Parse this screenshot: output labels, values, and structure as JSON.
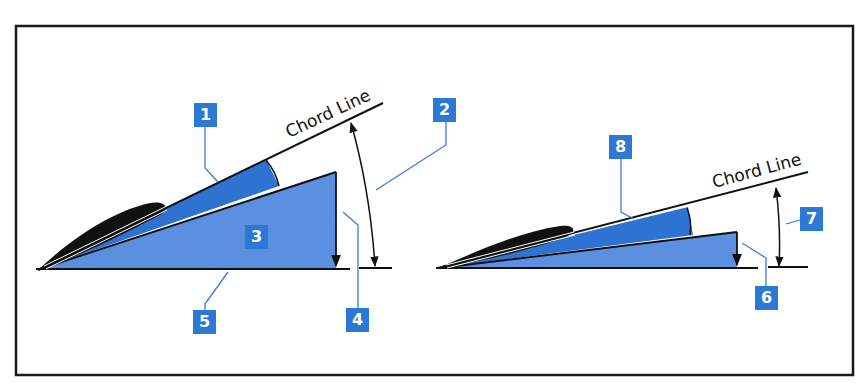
{
  "figure": {
    "title": "",
    "colors": {
      "frame": "#1a1a1a",
      "callout_bg": "#2b78d6",
      "wedge_dark": "#2f73d2",
      "wedge_light": "#5b8fe0",
      "leader_line": "#3a7bd5",
      "airfoil": "#111111"
    }
  },
  "left_diagram": {
    "chord_label": "Chord Line",
    "callouts": [
      {
        "id": "1",
        "text": "1"
      },
      {
        "id": "2",
        "text": "2"
      },
      {
        "id": "3",
        "text": "3"
      },
      {
        "id": "4",
        "text": "4"
      },
      {
        "id": "5",
        "text": "5"
      }
    ]
  },
  "right_diagram": {
    "chord_label": "Chord Line",
    "callouts": [
      {
        "id": "6",
        "text": "6"
      },
      {
        "id": "7",
        "text": "7"
      },
      {
        "id": "8",
        "text": "8"
      }
    ]
  }
}
